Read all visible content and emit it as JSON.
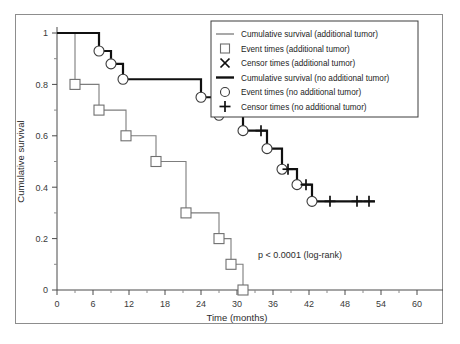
{
  "chart_data": {
    "type": "line",
    "title": "",
    "xlabel": "Time (months)",
    "ylabel": "Cumulative survival",
    "xlim": [
      0,
      60
    ],
    "ylim": [
      0,
      1
    ],
    "xticks": [
      0,
      6,
      12,
      18,
      24,
      30,
      36,
      42,
      48,
      54,
      60
    ],
    "xtick_labels": [
      "0",
      "6",
      "12",
      "18",
      "24",
      "30",
      "36",
      "42",
      "48",
      "54",
      "60"
    ],
    "yticks": [
      0,
      0.2,
      0.4,
      0.6,
      0.8,
      1
    ],
    "ytick_labels": [
      "0",
      "0.2",
      "0.4",
      "0.6",
      "0.8",
      "1"
    ],
    "grid": false,
    "legend_position": "top-right",
    "annotation": "p < 0.0001 (log-rank)",
    "series": [
      {
        "name": "Cumulative survival (additional tumor)",
        "style": "step-thin-grey",
        "event_marker": "square",
        "censor_marker": "x",
        "steps": [
          {
            "time": 0,
            "survival": 1.0
          },
          {
            "time": 3,
            "survival": 0.8
          },
          {
            "time": 7,
            "survival": 0.7
          },
          {
            "time": 11.5,
            "survival": 0.6
          },
          {
            "time": 16.5,
            "survival": 0.5
          },
          {
            "time": 21.5,
            "survival": 0.3
          },
          {
            "time": 27,
            "survival": 0.2
          },
          {
            "time": 29,
            "survival": 0.1
          },
          {
            "time": 31,
            "survival": 0.0
          }
        ],
        "event_times": [
          3,
          7,
          11.5,
          16.5,
          21.5,
          27,
          29,
          31
        ],
        "censor_times": []
      },
      {
        "name": "Cumulative survival (no additional tumor)",
        "style": "step-thick-black",
        "event_marker": "circle",
        "censor_marker": "plus",
        "steps": [
          {
            "time": 0,
            "survival": 1.0
          },
          {
            "time": 7,
            "survival": 0.93
          },
          {
            "time": 9,
            "survival": 0.88
          },
          {
            "time": 11,
            "survival": 0.82
          },
          {
            "time": 14,
            "survival": 0.82
          },
          {
            "time": 24,
            "survival": 0.75
          },
          {
            "time": 27,
            "survival": 0.68
          },
          {
            "time": 31,
            "survival": 0.62
          },
          {
            "time": 35,
            "survival": 0.55
          },
          {
            "time": 37.5,
            "survival": 0.47
          },
          {
            "time": 40,
            "survival": 0.41
          },
          {
            "time": 42.5,
            "survival": 0.345
          },
          {
            "time": 53,
            "survival": 0.345
          }
        ],
        "event_times": [
          7,
          9,
          11,
          24,
          27,
          31,
          35,
          37.5,
          40,
          42.5
        ],
        "censor_times": [
          34,
          38.5,
          41.5,
          45.5,
          50,
          52
        ]
      }
    ],
    "legend_entries": [
      {
        "label": "Cumulative survival (additional tumor)",
        "glyph": "line-thin"
      },
      {
        "label": "Event times (additional tumor)",
        "glyph": "square"
      },
      {
        "label": "Censor times (additional tumor)",
        "glyph": "x"
      },
      {
        "label": "Cumulative survival (no additional tumor)",
        "glyph": "line-thick"
      },
      {
        "label": "Event times (no additional tumor)",
        "glyph": "circle"
      },
      {
        "label": "Censor times (no additional tumor)",
        "glyph": "plus"
      }
    ]
  },
  "colors": {
    "grey_curve": "#7d7d7d",
    "black_curve": "#101010",
    "frame": "#8d8d8d",
    "background": "#ffffff"
  }
}
